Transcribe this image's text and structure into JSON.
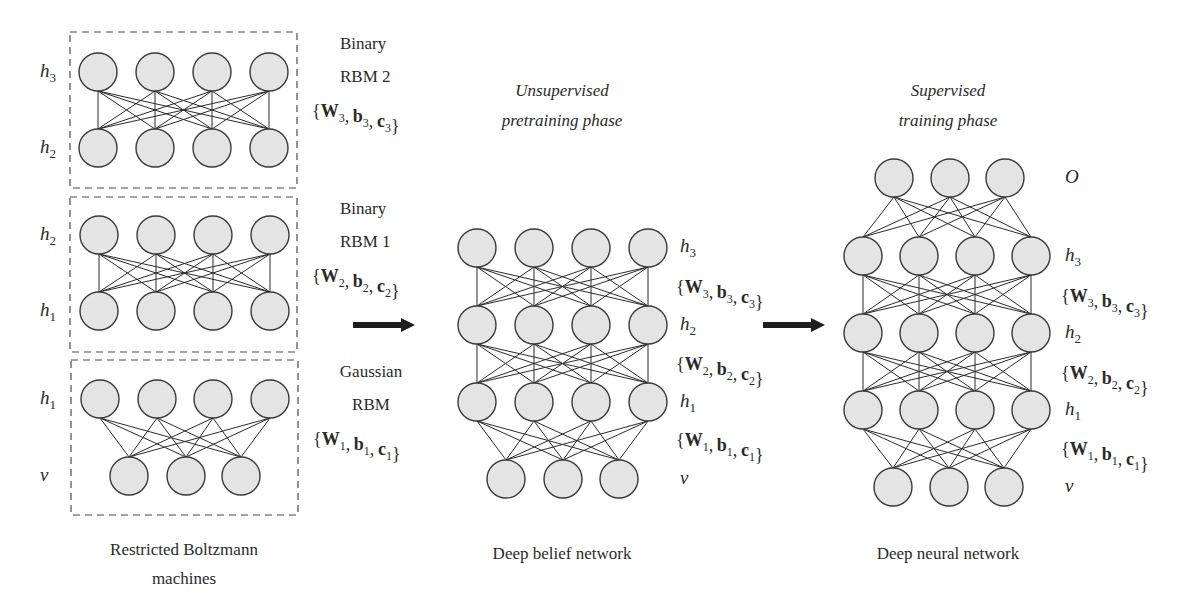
{
  "colors": {
    "node_fill": "#e4e4e4",
    "node_stroke": "#3a3a3a",
    "edge": "#2b2b2b",
    "text": "#2a2a2a",
    "arrow": "#1e1e1e"
  },
  "node_radius": 19,
  "rbm_panel": {
    "caption_line1": "Restricted Boltzmann",
    "caption_line2": "machines",
    "boxes": [
      {
        "id": "rbm2",
        "box": {
          "x": 70,
          "y": 32,
          "w": 227,
          "h": 156
        },
        "type_line1": "Binary",
        "type_line2": "RBM 2",
        "params": {
          "W": "W",
          "b": "b",
          "c": "c",
          "sub": "3"
        },
        "top_label": "h",
        "top_sub": "3",
        "bottom_label": "h",
        "bottom_sub": "2",
        "top_nodes": [
          [
            98,
            72
          ],
          [
            155,
            72
          ],
          [
            212,
            72
          ],
          [
            269,
            72
          ]
        ],
        "bottom_nodes": [
          [
            98,
            148
          ],
          [
            155,
            148
          ],
          [
            212,
            148
          ],
          [
            269,
            148
          ]
        ],
        "fully_connected": true
      },
      {
        "id": "rbm1",
        "box": {
          "x": 70,
          "y": 197,
          "w": 227,
          "h": 155
        },
        "type_line1": "Binary",
        "type_line2": "RBM 1",
        "params": {
          "W": "W",
          "b": "b",
          "c": "c",
          "sub": "2"
        },
        "top_label": "h",
        "top_sub": "2",
        "bottom_label": "h",
        "bottom_sub": "1",
        "top_nodes": [
          [
            99,
            235
          ],
          [
            156,
            235
          ],
          [
            213,
            235
          ],
          [
            270,
            235
          ]
        ],
        "bottom_nodes": [
          [
            99,
            311
          ],
          [
            156,
            311
          ],
          [
            213,
            311
          ],
          [
            270,
            311
          ]
        ],
        "fully_connected": true
      },
      {
        "id": "gaussian-rbm",
        "box": {
          "x": 71,
          "y": 360,
          "w": 227,
          "h": 155
        },
        "type_line1": "Gaussian",
        "type_line2": "RBM",
        "params": {
          "W": "W",
          "b": "b",
          "c": "c",
          "sub": "1"
        },
        "top_label": "h",
        "top_sub": "1",
        "bottom_label": "v",
        "bottom_sub": "",
        "top_nodes": [
          [
            100,
            399
          ],
          [
            157,
            399
          ],
          [
            213,
            399
          ],
          [
            270,
            399
          ]
        ],
        "bottom_nodes": [
          [
            129,
            476
          ],
          [
            186,
            476
          ],
          [
            241,
            476
          ]
        ],
        "fully_connected": true
      }
    ]
  },
  "arrows": [
    {
      "id": "arrow-rbm-to-dbn",
      "x1": 353,
      "y": 325,
      "x2": 415
    },
    {
      "id": "arrow-dbn-to-dnn",
      "x1": 763,
      "y": 325,
      "x2": 825
    }
  ],
  "dbn_panel": {
    "title_line1": "Unsupervised",
    "title_line2": "pretraining phase",
    "caption": "Deep belief network",
    "layers": [
      {
        "label": "h",
        "sub": "3",
        "label_y": 252,
        "nodes": [
          [
            477,
            248
          ],
          [
            534,
            248
          ],
          [
            591,
            248
          ],
          [
            648,
            248
          ]
        ]
      },
      {
        "label": "h",
        "sub": "2",
        "label_y": 330,
        "nodes": [
          [
            477,
            325
          ],
          [
            534,
            325
          ],
          [
            591,
            325
          ],
          [
            648,
            325
          ]
        ]
      },
      {
        "label": "h",
        "sub": "1",
        "label_y": 407,
        "nodes": [
          [
            477,
            402
          ],
          [
            534,
            402
          ],
          [
            591,
            402
          ],
          [
            648,
            402
          ]
        ]
      },
      {
        "label": "v",
        "sub": "",
        "label_y": 484,
        "nodes": [
          [
            506,
            479
          ],
          [
            563,
            479
          ],
          [
            619,
            479
          ]
        ]
      }
    ],
    "params": [
      {
        "sub": "3",
        "y": 293
      },
      {
        "sub": "2",
        "y": 370
      },
      {
        "sub": "1",
        "y": 446
      }
    ],
    "label_x": 680
  },
  "dnn_panel": {
    "title_line1": "Supervised",
    "title_line2": "training phase",
    "caption": "Deep neural network",
    "layers": [
      {
        "label": "O",
        "sub": "",
        "italic_only": true,
        "label_y": 183,
        "nodes": [
          [
            894,
            178
          ],
          [
            950,
            178
          ],
          [
            1005,
            178
          ]
        ]
      },
      {
        "label": "h",
        "sub": "3",
        "label_y": 261,
        "nodes": [
          [
            863,
            256
          ],
          [
            919,
            256
          ],
          [
            975,
            256
          ],
          [
            1031,
            256
          ]
        ]
      },
      {
        "label": "h",
        "sub": "2",
        "label_y": 338,
        "nodes": [
          [
            863,
            333
          ],
          [
            919,
            333
          ],
          [
            975,
            333
          ],
          [
            1031,
            333
          ]
        ]
      },
      {
        "label": "h",
        "sub": "1",
        "label_y": 415,
        "nodes": [
          [
            863,
            410
          ],
          [
            919,
            410
          ],
          [
            975,
            410
          ],
          [
            1031,
            410
          ]
        ]
      },
      {
        "label": "v",
        "sub": "",
        "label_y": 492,
        "nodes": [
          [
            893,
            487
          ],
          [
            949,
            487
          ],
          [
            1004,
            487
          ]
        ]
      }
    ],
    "params": [
      {
        "sub": "3",
        "y": 302
      },
      {
        "sub": "2",
        "y": 379
      },
      {
        "sub": "1",
        "y": 455
      }
    ],
    "label_x": 1065
  }
}
